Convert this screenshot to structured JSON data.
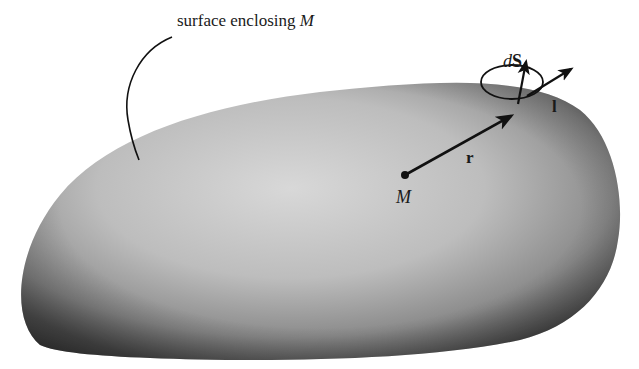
{
  "figure": {
    "callout_label": {
      "text": "surface enclosing ",
      "var": "M"
    },
    "mass_label": "M",
    "radius_label": "r",
    "area_element_label": {
      "d": "d",
      "vec": "S"
    },
    "unit_vector_label": "l"
  },
  "colors": {
    "background": "#ffffff",
    "ink": "#1a1a1a",
    "surface_light": "#d6d6d6",
    "surface_dark": "#3a3a3a"
  }
}
